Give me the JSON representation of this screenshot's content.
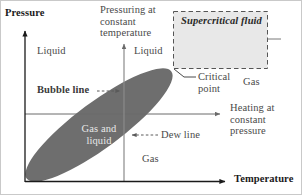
{
  "diagram": {
    "axes": {
      "y_label": "Pressure",
      "x_label": "Temperature"
    },
    "colors": {
      "two_phase_fill": "#6e6e6e",
      "supercritical_fill": "#e6e6e6",
      "axis_line": "#1a1a1a",
      "process_line": "#808080",
      "text": "#4a4a4a",
      "background": "#ffffff"
    },
    "labels": {
      "pressuring_at_constant_temperature": "Pressuring at\nconstant\ntemperature",
      "liquid_left": "Liquid",
      "liquid_right": "Liquid",
      "supercritical_fluid": "Supercritical fluid",
      "bubble_line": "Bubble line",
      "dew_line": "Dew line",
      "critical_point": "Critical\npoint",
      "gas_right": "Gas",
      "heating_at_constant_pressure": "Heating at\nconstant\npressure",
      "gas_and_liquid": "Gas and\nliquid",
      "gas_bottom": "Gas"
    },
    "icons": {
      "pressure_axis_arrow": "up-arrow-icon",
      "temperature_axis_arrow": "right-arrow-icon",
      "pressuring_arrow": "up-arrow-icon",
      "heating_arrow": "right-arrow-icon",
      "bubble_line_arrow": "dashed-right-arrow-icon",
      "dew_line_arrow": "dashed-left-arrow-icon",
      "critical_point_leader": "leader-line-icon",
      "supercritical_box": "dashed-rectangle-icon",
      "two_phase_envelope": "filled-ellipse-icon"
    },
    "geometry": {
      "pressure_axis_x": 24,
      "temperature_axis_y": 180,
      "isotherm_x": 123,
      "isobar_y": 113,
      "critical_point_x": 172,
      "critical_point_y": 68,
      "envelope_angle_deg": -36
    }
  }
}
